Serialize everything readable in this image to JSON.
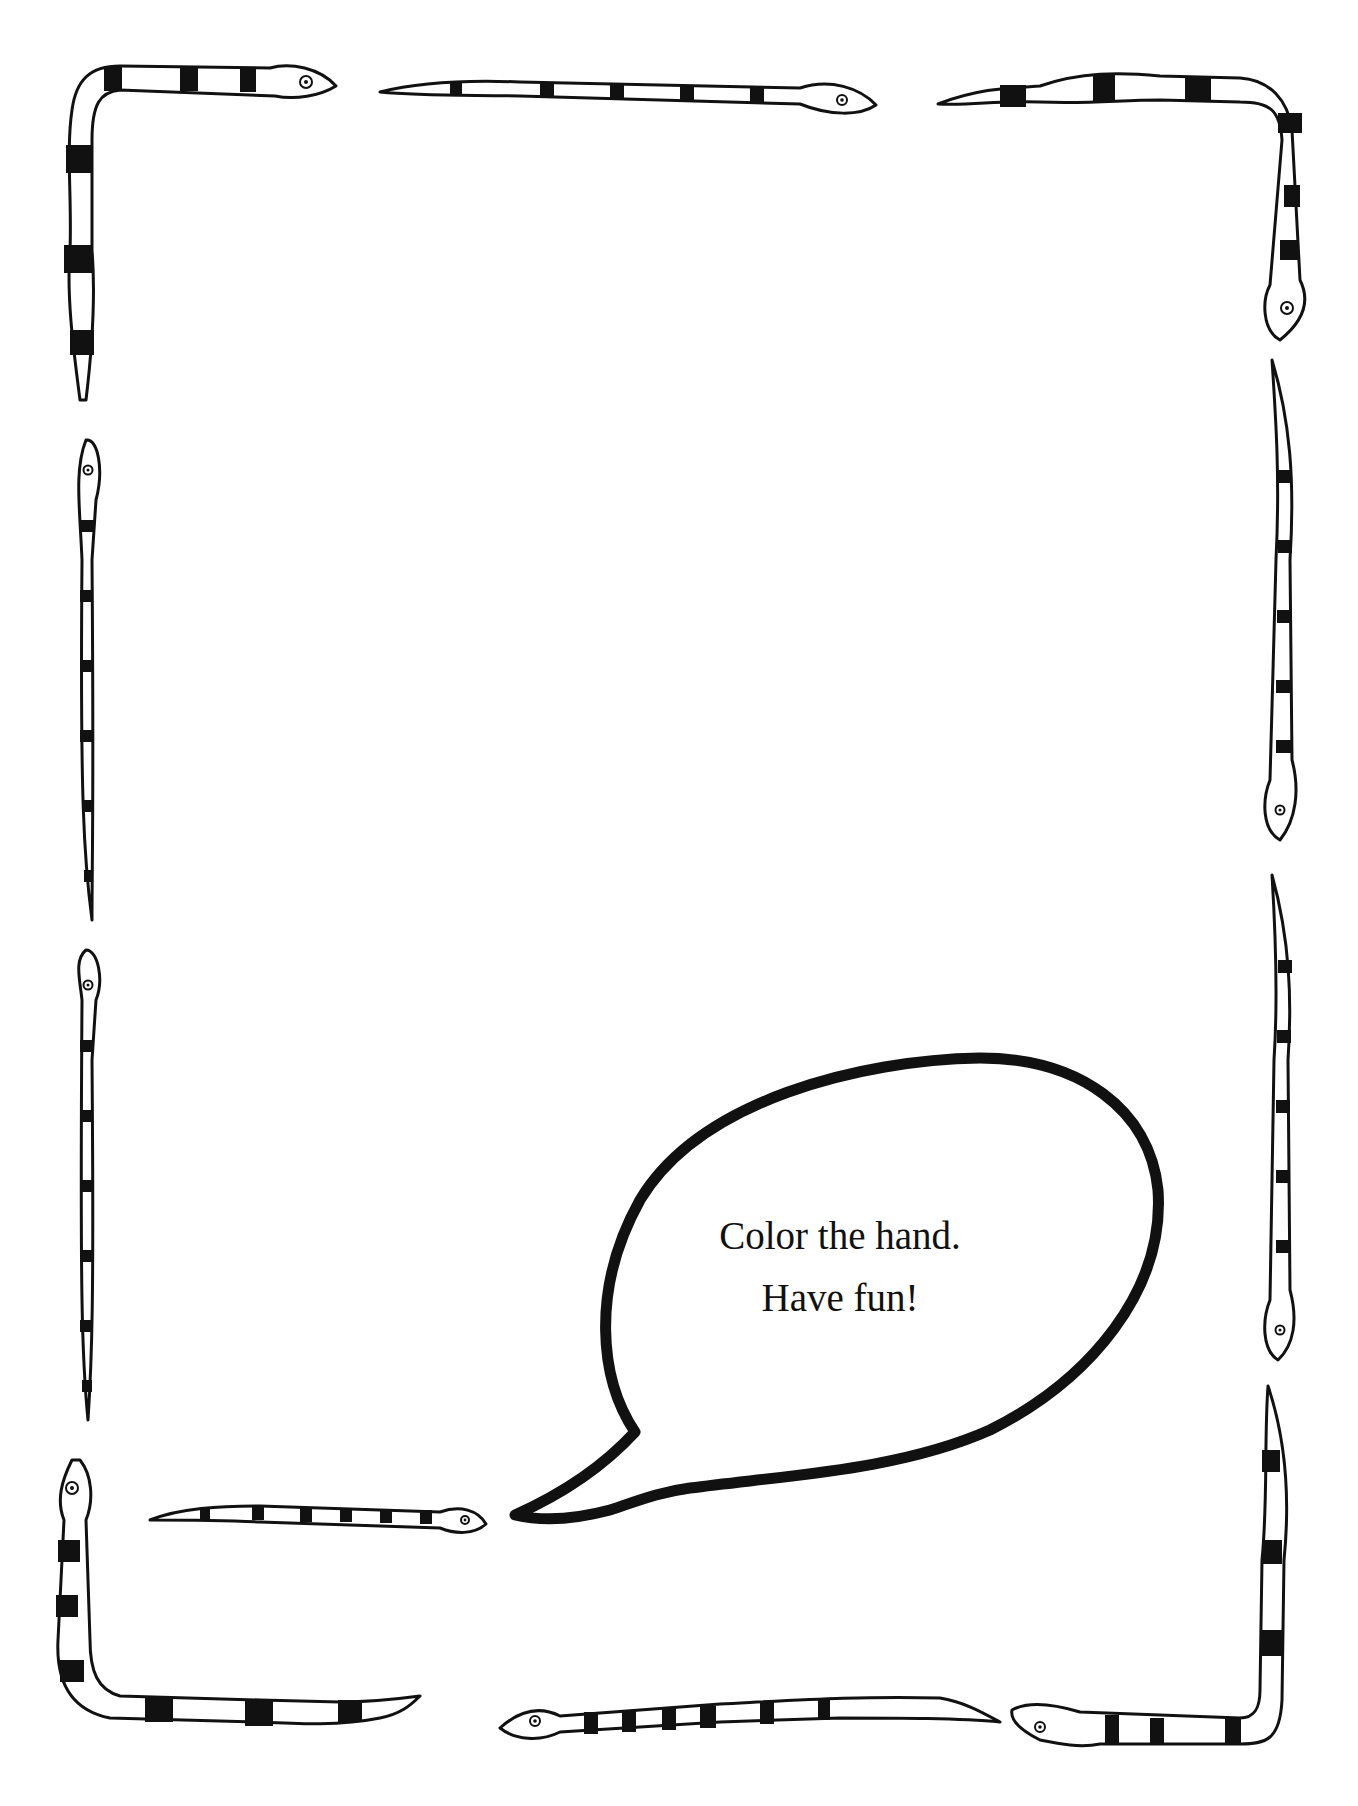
{
  "page": {
    "type": "coloring-page",
    "background": "#ffffff",
    "ink": "#111111"
  },
  "speech_bubble": {
    "line1": "Color the hand.",
    "line2": "Have fun!"
  },
  "border": {
    "description": "Frame of striped snakes around the page",
    "snake_count": 12
  }
}
